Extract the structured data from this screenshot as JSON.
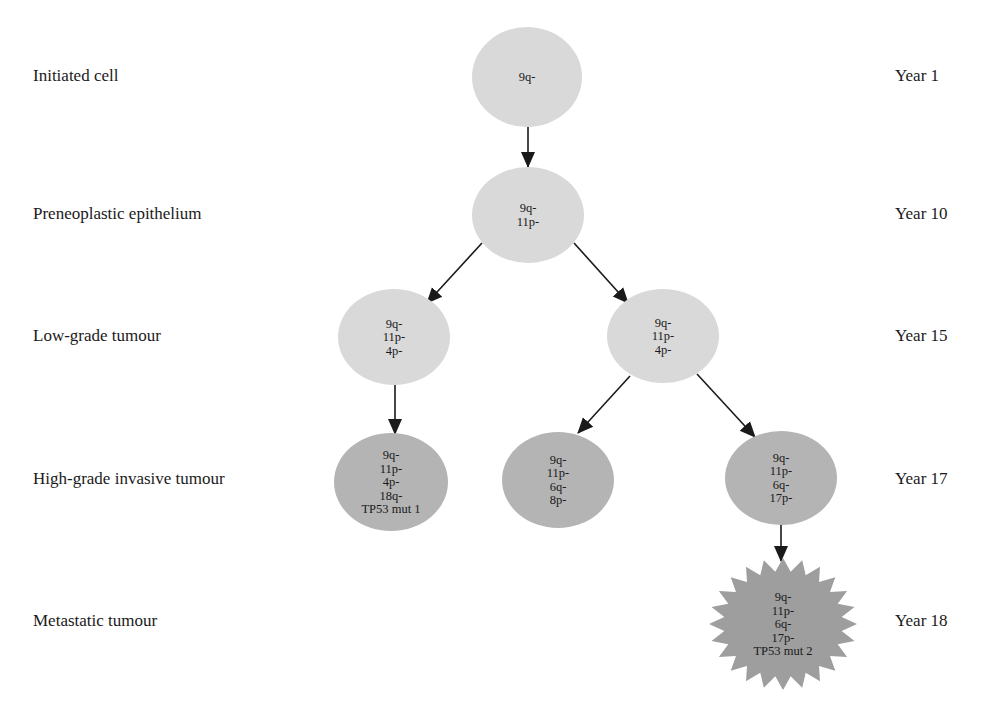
{
  "stages": [
    {
      "label": "Initiated cell",
      "year": "Year 1",
      "y": 77
    },
    {
      "label": "Preneoplastic epithelium",
      "year": "Year 10",
      "y": 215
    },
    {
      "label": "Low-grade tumour",
      "year": "Year 15",
      "y": 337
    },
    {
      "label": "High-grade invasive tumour",
      "year": "Year 17",
      "y": 480
    },
    {
      "label": "Metastatic tumour",
      "year": "Year 18",
      "y": 622
    }
  ],
  "colors": {
    "light_node": "#d9d9d9",
    "mid_node": "#b4b4b4",
    "metastatic_node": "#9e9e9e",
    "arrow": "#1a1a1a"
  },
  "nodes": [
    {
      "id": "initiated",
      "shape": "ellipse",
      "cx": 527,
      "cy": 77,
      "rx": 55,
      "ry": 50,
      "fill": "light_node",
      "lines": [
        "9q-"
      ]
    },
    {
      "id": "preneoplastic",
      "shape": "ellipse",
      "cx": 528,
      "cy": 215,
      "rx": 56,
      "ry": 48,
      "fill": "light_node",
      "lines": [
        "9q-",
        "11p-"
      ]
    },
    {
      "id": "lowgrade-left",
      "shape": "ellipse",
      "cx": 394,
      "cy": 337,
      "rx": 56,
      "ry": 48,
      "fill": "light_node",
      "lines": [
        "9q-",
        "11p-",
        "4p-"
      ]
    },
    {
      "id": "lowgrade-right",
      "shape": "ellipse",
      "cx": 663,
      "cy": 336,
      "rx": 56,
      "ry": 47,
      "fill": "light_node",
      "lines": [
        "9q-",
        "11p-",
        "4p-"
      ]
    },
    {
      "id": "highgrade-left",
      "shape": "ellipse",
      "cx": 391,
      "cy": 482,
      "rx": 57,
      "ry": 49,
      "fill": "mid_node",
      "lines": [
        "9q-",
        "11p-",
        "4p-",
        "18q-",
        "TP53 mut 1"
      ]
    },
    {
      "id": "highgrade-middle",
      "shape": "ellipse",
      "cx": 558,
      "cy": 480,
      "rx": 56,
      "ry": 48,
      "fill": "mid_node",
      "lines": [
        "9q-",
        "11p-",
        "6q-",
        "8p-"
      ]
    },
    {
      "id": "highgrade-right",
      "shape": "ellipse",
      "cx": 781,
      "cy": 478,
      "rx": 56,
      "ry": 47,
      "fill": "mid_node",
      "lines": [
        "9q-",
        "11p-",
        "6q-",
        "17p-"
      ]
    },
    {
      "id": "metastatic",
      "shape": "star",
      "cx": 783,
      "cy": 624,
      "rx": 74,
      "ry": 66,
      "inner": 0.8,
      "points": 24,
      "fill": "metastatic_node",
      "lines": [
        "9q-",
        "11p-",
        "6q-",
        "17p-",
        "TP53 mut 2"
      ]
    }
  ],
  "edges": [
    {
      "from": "initiated",
      "to": "preneoplastic",
      "x1": 528,
      "y1": 127,
      "x2": 528,
      "y2": 167
    },
    {
      "from": "preneoplastic",
      "to": "lowgrade-left",
      "x1": 482,
      "y1": 243,
      "x2": 427,
      "y2": 303
    },
    {
      "from": "preneoplastic",
      "to": "lowgrade-right",
      "x1": 574,
      "y1": 243,
      "x2": 628,
      "y2": 303
    },
    {
      "from": "lowgrade-left",
      "to": "highgrade-left",
      "x1": 395,
      "y1": 385,
      "x2": 395,
      "y2": 434
    },
    {
      "from": "lowgrade-right",
      "to": "highgrade-middle",
      "x1": 630,
      "y1": 376,
      "x2": 578,
      "y2": 433
    },
    {
      "from": "lowgrade-right",
      "to": "highgrade-right",
      "x1": 697,
      "y1": 374,
      "x2": 755,
      "y2": 437
    },
    {
      "from": "highgrade-right",
      "to": "metastatic",
      "x1": 781,
      "y1": 525,
      "x2": 781,
      "y2": 561
    }
  ]
}
